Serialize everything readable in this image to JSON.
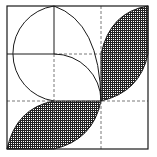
{
  "diagram": {
    "title": "",
    "colors": {
      "background": "#ffffff",
      "stroke": "#1a1a1a",
      "dash": "#555555",
      "hatch": "#222222"
    },
    "square": {
      "x": 7,
      "y": 6,
      "size": 141
    },
    "grid": {
      "divisions": 3,
      "style": "dashed"
    },
    "shaded_regions": [
      {
        "name": "top-right-lens",
        "pattern": "crosshatch"
      },
      {
        "name": "bottom-left-lens",
        "pattern": "crosshatch"
      }
    ],
    "unshaded_regions": [
      {
        "name": "top-left-circle-figure"
      }
    ]
  }
}
